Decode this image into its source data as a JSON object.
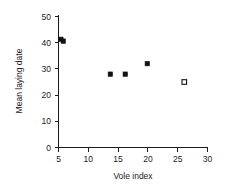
{
  "chart_data": {
    "type": "scatter",
    "title": "",
    "xlabel": "Vole index",
    "ylabel": "Mean laying date",
    "xlim": [
      5,
      30
    ],
    "ylim": [
      0,
      50
    ],
    "xticks": [
      5,
      10,
      15,
      20,
      25,
      30
    ],
    "yticks": [
      0,
      10,
      20,
      30,
      40,
      50
    ],
    "xtick_labels": [
      "5",
      "10",
      "15",
      "20",
      "25",
      "30"
    ],
    "ytick_labels": [
      "0",
      "10",
      "20",
      "30",
      "40",
      "50"
    ],
    "grid": false,
    "legend": null,
    "series": [
      {
        "name": "filled",
        "marker": "filled-square",
        "color": "#111111",
        "points": [
          {
            "x": 5.4,
            "y": 41.3
          },
          {
            "x": 5.8,
            "y": 40.6
          },
          {
            "x": 13.7,
            "y": 28.0
          },
          {
            "x": 16.2,
            "y": 28.0
          },
          {
            "x": 19.9,
            "y": 32.0
          }
        ]
      },
      {
        "name": "open",
        "marker": "open-square",
        "color": "#111111",
        "points": [
          {
            "x": 26.1,
            "y": 25.0
          }
        ]
      }
    ]
  },
  "axis": {
    "x_title": "Vole index",
    "y_title": "Mean laying date"
  },
  "ticks": {
    "x": [
      "5",
      "10",
      "15",
      "20",
      "25",
      "30"
    ],
    "y": [
      "0",
      "10",
      "20",
      "30",
      "40",
      "50"
    ]
  }
}
